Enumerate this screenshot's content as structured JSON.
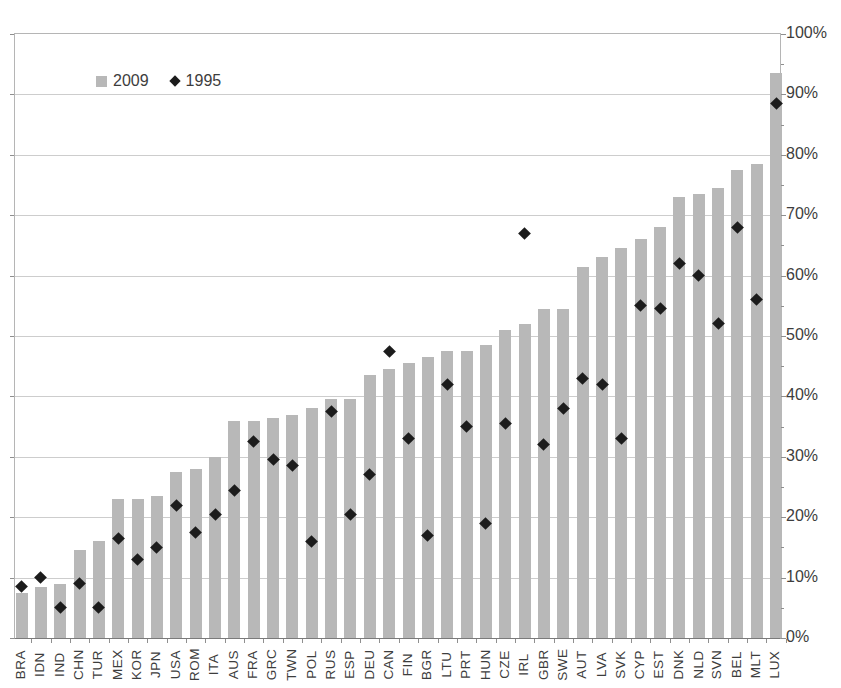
{
  "chart_data": {
    "type": "bar",
    "categories": [
      "BRA",
      "IDN",
      "IND",
      "CHN",
      "TUR",
      "MEX",
      "KOR",
      "JPN",
      "USA",
      "ROM",
      "ITA",
      "AUS",
      "FRA",
      "GRC",
      "TWN",
      "POL",
      "RUS",
      "ESP",
      "DEU",
      "CAN",
      "FIN",
      "BGR",
      "LTU",
      "PRT",
      "HUN",
      "CZE",
      "IRL",
      "GBR",
      "SWE",
      "AUT",
      "LVA",
      "SVK",
      "CYP",
      "EST",
      "DNK",
      "NLD",
      "SVN",
      "BEL",
      "MLT",
      "LUX"
    ],
    "series": [
      {
        "name": "2009",
        "type": "bar",
        "color": "#b8b8b8",
        "values": [
          7.5,
          8.5,
          9,
          14.5,
          16,
          23,
          23,
          23.5,
          27.5,
          28,
          30,
          36,
          36,
          36.5,
          37,
          38,
          39.5,
          39.5,
          43.5,
          44.5,
          45.5,
          46.5,
          47.5,
          47.5,
          48.5,
          51,
          52,
          54.5,
          54.5,
          61.5,
          63,
          64.5,
          66,
          68,
          73,
          73.5,
          74.5,
          77.5,
          78.5,
          93.5
        ]
      },
      {
        "name": "1995",
        "type": "scatter",
        "marker": "diamond",
        "color": "#1c1c1c",
        "values": [
          8.5,
          10,
          5,
          9,
          5,
          16.5,
          13,
          15,
          22,
          17.5,
          20.5,
          24.5,
          32.5,
          29.5,
          28.5,
          16,
          37.5,
          20.5,
          27,
          47.5,
          33,
          17,
          42,
          35,
          19,
          35.5,
          67,
          32,
          38,
          43,
          42,
          33,
          55,
          54.5,
          62,
          60,
          52,
          68,
          56,
          88.5
        ]
      }
    ],
    "ylabel": "",
    "xlabel": "",
    "y_axis": {
      "side": "right",
      "min": 0,
      "max": 100,
      "major_step": 10,
      "minor_step": 5,
      "unit": "%",
      "tick_labels": [
        "0%",
        "10%",
        "20%",
        "30%",
        "40%",
        "50%",
        "60%",
        "70%",
        "80%",
        "90%",
        "100%"
      ]
    },
    "x_axis": {
      "label_rotation": -90
    },
    "grid": "horizontal-major",
    "legend_position": "top-left-inside"
  },
  "legend": {
    "items": [
      {
        "label": "2009",
        "marker": "square",
        "color": "#b8b8b8"
      },
      {
        "label": "1995",
        "marker": "diamond",
        "color": "#1c1c1c"
      }
    ]
  },
  "colors": {
    "bar": "#b8b8b8",
    "diamond": "#1c1c1c",
    "gridline": "#cdcdcd",
    "axis_line": "#7a7a7a",
    "text": "#3d3d3d"
  }
}
